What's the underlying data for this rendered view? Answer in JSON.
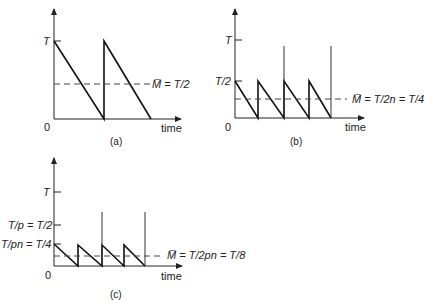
{
  "figure": {
    "panels": [
      {
        "id": "a",
        "caption": "(a)",
        "origin_label": "0",
        "x_axis_label": "time",
        "y_ticks": [
          {
            "label": "T",
            "value": "T"
          }
        ],
        "mean_label": "M̅ = T/2",
        "description": "Sawtooth of height T with two teeth; mean line at T/2"
      },
      {
        "id": "b",
        "caption": "(b)",
        "origin_label": "0",
        "x_axis_label": "time",
        "y_ticks": [
          {
            "label": "T",
            "value": "T"
          },
          {
            "label": "T/2",
            "value": "T/2"
          }
        ],
        "mean_label": "M̅ = T/2n = T/4",
        "description": "Sawtooth of height T/2 with four teeth; vertical spikes to near T at periods 2 and 4; mean line at T/4"
      },
      {
        "id": "c",
        "caption": "(c)",
        "origin_label": "0",
        "x_axis_label": "time",
        "y_ticks": [
          {
            "label": "T",
            "value": "T"
          },
          {
            "label": "T/p = T/2",
            "value": "T/2"
          },
          {
            "label": "T/pn = T/4",
            "value": "T/4"
          }
        ],
        "mean_label": "M̅ = T/2pn = T/8",
        "description": "Sawtooth of height T/4 with four teeth; vertical spikes to about T/2 at teeth 2 and 4; mean line at T/8"
      }
    ]
  }
}
